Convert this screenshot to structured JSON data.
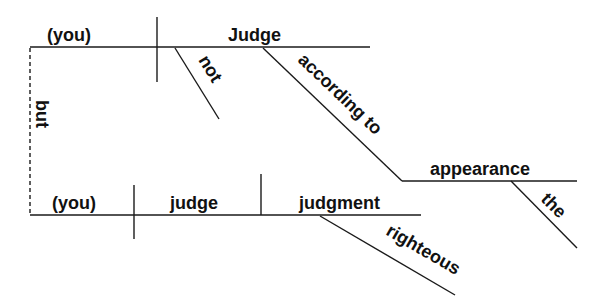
{
  "diagram": {
    "type": "sentence-diagram",
    "conjunction": {
      "word": "but"
    },
    "clause1": {
      "subject": "(you)",
      "verb": "Judge",
      "modifiers": [
        {
          "word": "not",
          "modifies": "Judge"
        },
        {
          "word": "according to",
          "modifies": "Judge",
          "object": "appearance",
          "object_modifier": "the"
        }
      ]
    },
    "clause2": {
      "subject": "(you)",
      "verb": "judge",
      "direct_object": "judgment",
      "object_modifier": "righteous"
    },
    "colors": {
      "line": "#1a1a1a",
      "text": "#111111",
      "background": "#ffffff"
    }
  }
}
